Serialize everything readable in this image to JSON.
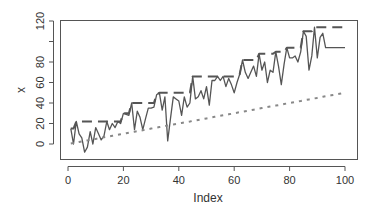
{
  "chart_data": {
    "type": "line",
    "title": "",
    "xlabel": "Index",
    "ylabel": "x",
    "xlim": [
      1,
      100
    ],
    "ylim": [
      -12,
      120
    ],
    "x_ticks": [
      0,
      20,
      40,
      60,
      80,
      100
    ],
    "y_ticks": [
      0,
      20,
      40,
      60,
      80,
      100,
      120
    ],
    "y_tick_labels": [
      "0",
      "20",
      "40",
      "60",
      "80",
      "",
      "120"
    ],
    "grid": false,
    "legend": null,
    "x": [
      1,
      2,
      3,
      4,
      5,
      6,
      7,
      8,
      9,
      10,
      11,
      12,
      13,
      14,
      15,
      16,
      17,
      18,
      19,
      20,
      21,
      22,
      23,
      24,
      25,
      26,
      27,
      28,
      29,
      30,
      31,
      32,
      33,
      34,
      35,
      36,
      37,
      38,
      39,
      40,
      41,
      42,
      43,
      44,
      45,
      46,
      47,
      48,
      49,
      50,
      51,
      52,
      53,
      54,
      55,
      56,
      57,
      58,
      59,
      60,
      61,
      62,
      63,
      64,
      65,
      66,
      67,
      68,
      69,
      70,
      71,
      72,
      73,
      74,
      75,
      76,
      77,
      78,
      79,
      80,
      81,
      82,
      83,
      84,
      85,
      86,
      87,
      88,
      89,
      90,
      91,
      92,
      93,
      94,
      95,
      96,
      97,
      98,
      99,
      100
    ],
    "series": [
      {
        "name": "x",
        "style": "solid",
        "color": "#555555",
        "values": [
          15,
          0,
          22,
          10,
          6,
          -8,
          -3,
          12,
          0,
          16,
          10,
          4,
          8,
          22,
          14,
          20,
          16,
          22,
          20,
          30,
          29,
          28,
          40,
          14,
          32,
          26,
          14,
          25,
          35,
          35,
          36,
          48,
          50,
          33,
          46,
          3,
          25,
          46,
          44,
          42,
          28,
          46,
          36,
          40,
          66,
          44,
          46,
          52,
          44,
          56,
          38,
          62,
          62,
          66,
          62,
          66,
          56,
          64,
          58,
          50,
          60,
          68,
          82,
          70,
          64,
          70,
          76,
          66,
          88,
          72,
          80,
          60,
          72,
          70,
          90,
          76,
          58,
          78,
          94,
          84,
          84,
          86,
          80,
          90,
          110,
          105,
          72,
          86,
          114,
          84,
          104,
          108,
          94,
          94,
          94,
          94,
          94,
          94,
          94,
          94
        ]
      },
      {
        "name": "cummax(x)",
        "style": "dashed",
        "color": "#555555",
        "values": [
          15,
          15,
          22,
          22,
          22,
          22,
          22,
          22,
          22,
          22,
          22,
          22,
          22,
          22,
          22,
          22,
          22,
          22,
          22,
          30,
          30,
          30,
          40,
          40,
          40,
          40,
          40,
          40,
          40,
          40,
          40,
          48,
          50,
          50,
          50,
          50,
          50,
          50,
          50,
          50,
          50,
          50,
          50,
          50,
          66,
          66,
          66,
          66,
          66,
          66,
          66,
          66,
          66,
          66,
          66,
          66,
          66,
          66,
          66,
          66,
          66,
          68,
          82,
          82,
          82,
          82,
          82,
          82,
          88,
          88,
          88,
          88,
          88,
          88,
          90,
          90,
          90,
          90,
          94,
          94,
          94,
          94,
          94,
          94,
          110,
          110,
          110,
          110,
          114,
          114,
          114,
          114,
          114,
          114,
          114,
          114,
          114,
          114,
          114,
          114
        ]
      },
      {
        "name": "trend",
        "style": "dotted",
        "color": "#888888",
        "values": [
          0.5,
          1,
          1.5,
          2,
          2.5,
          3,
          3.5,
          4,
          4.5,
          5,
          5.5,
          6,
          6.5,
          7,
          7.5,
          8,
          8.5,
          9,
          9.5,
          10,
          10.5,
          11,
          11.5,
          12,
          12.5,
          13,
          13.5,
          14,
          14.5,
          15,
          15.5,
          16,
          16.5,
          17,
          17.5,
          18,
          18.5,
          19,
          19.5,
          20,
          20.5,
          21,
          21.5,
          22,
          22.5,
          23,
          23.5,
          24,
          24.5,
          25,
          25.5,
          26,
          26.5,
          27,
          27.5,
          28,
          28.5,
          29,
          29.5,
          30,
          30.5,
          31,
          31.5,
          32,
          32.5,
          33,
          33.5,
          34,
          34.5,
          35,
          35.5,
          36,
          36.5,
          37,
          37.5,
          38,
          38.5,
          39,
          39.5,
          40,
          40.5,
          41,
          41.5,
          42,
          42.5,
          43,
          43.5,
          44,
          44.5,
          45,
          45.5,
          46,
          46.5,
          47,
          47.5,
          48,
          48.5,
          49,
          49.5,
          50
        ]
      }
    ]
  }
}
